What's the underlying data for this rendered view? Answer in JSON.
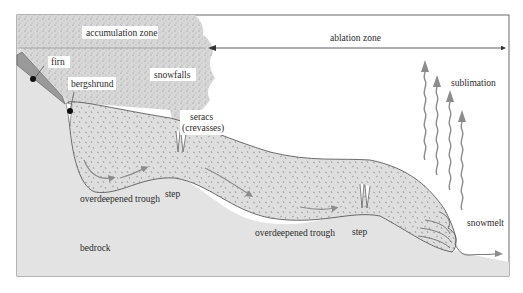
{
  "diagram": {
    "labels": {
      "accumulation_zone": "accumulation zone",
      "ablation_zone": "ablation zone",
      "firn": "firn",
      "bergshrund": "bergshrund",
      "snowfalls": "snowfalls",
      "seracs": "seracs",
      "crevasses": "(crevasses)",
      "sublimation": "sublimation",
      "overdeepened_trough_1": "overdeepened trough",
      "step_1": "step",
      "overdeepened_trough_2": "overdeepened trough",
      "step_2": "step",
      "snowmelt": "snowmelt",
      "bedrock": "bedrock"
    },
    "colors": {
      "bedrock": "#e4e4e4",
      "ice": "#dcdcdc",
      "snow": "#d2d2d2",
      "firn": "#9a9a9a",
      "line": "#4a4a4a",
      "arrow": "#8c8c8c",
      "frame": "#6a6a6a"
    }
  }
}
